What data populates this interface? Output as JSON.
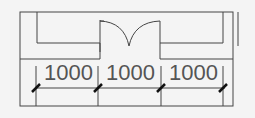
{
  "diagram": {
    "type": "floor-plan-dimensions",
    "dimensions": [
      {
        "label": "1000"
      },
      {
        "label": "1000"
      },
      {
        "label": "1000"
      }
    ],
    "elements": [
      "outer-wall",
      "left-cabinet",
      "double-door",
      "right-cabinet",
      "dimension-line",
      "tick-marks"
    ],
    "colors": {
      "line": "#444444",
      "background": "#f4f4f4",
      "text": "#555555"
    }
  }
}
